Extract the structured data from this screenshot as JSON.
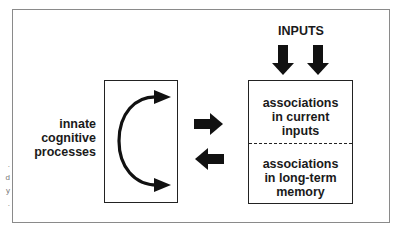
{
  "diagram": {
    "left_label": [
      "innate",
      "cognitive",
      "processes"
    ],
    "inputs_label": "INPUTS",
    "right_box": {
      "top_cell": [
        "associations",
        "in current",
        "inputs"
      ],
      "bottom_cell": [
        "associations",
        "in long-term",
        "memory"
      ]
    },
    "edge_fragments": [
      ".",
      "d",
      "y",
      "."
    ],
    "colors": {
      "ink": "#111111",
      "frame": "#8a8a8a",
      "background": "#ffffff"
    }
  }
}
